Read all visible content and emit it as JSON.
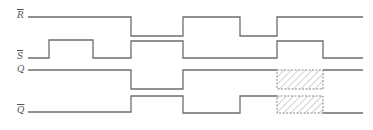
{
  "diagram": {
    "type": "timing-diagram",
    "signals": [
      {
        "name": "R",
        "inverted": true,
        "label": "R",
        "label_pos": {
          "x": 17,
          "y": 12
        },
        "high_y": 17,
        "low_y": 36,
        "path": "M 28 17 L 131 17 L 131 36 L 183 36 L 183 17 L 240 17 L 240 36 L 277 36 L 277 17 L 363 17"
      },
      {
        "name": "S",
        "inverted": true,
        "label": "S",
        "label_pos": {
          "x": 17,
          "y": 53
        },
        "high_y": 40,
        "low_y": 58,
        "path": "M 28 58 L 49 58 L 49 40 L 93 40 L 93 58 L 131 58 L 131 41 L 183 41 L 183 58 L 277 58 L 277 41 L 323 41 L 323 58 L 363 58"
      },
      {
        "name": "Q",
        "inverted": false,
        "label": "Q",
        "label_pos": {
          "x": 17,
          "y": 65
        },
        "high_y": 70,
        "low_y": 89,
        "path": "M 28 70 L 131 70 L 131 89 L 183 89 L 183 70 L 277 70 M 323 70 L 363 70"
      },
      {
        "name": "Q-bar",
        "inverted": true,
        "label": "Q",
        "label_pos": {
          "x": 17,
          "y": 107
        },
        "high_y": 96,
        "low_y": 113,
        "path": "M 28 112 L 131 112 L 131 96 L 183 96 L 183 113 L 240 113 L 240 96 L 277 96 M 323 113 L 363 113"
      }
    ],
    "undefined_regions": [
      {
        "signal": "Q",
        "x": 277,
        "y": 70,
        "width": 46,
        "height": 19
      },
      {
        "signal": "Q-bar",
        "x": 277,
        "y": 96,
        "width": 46,
        "height": 17
      }
    ],
    "colors": {
      "line": "#6e6e6e",
      "label": "#555555",
      "background": "#ffffff"
    }
  }
}
